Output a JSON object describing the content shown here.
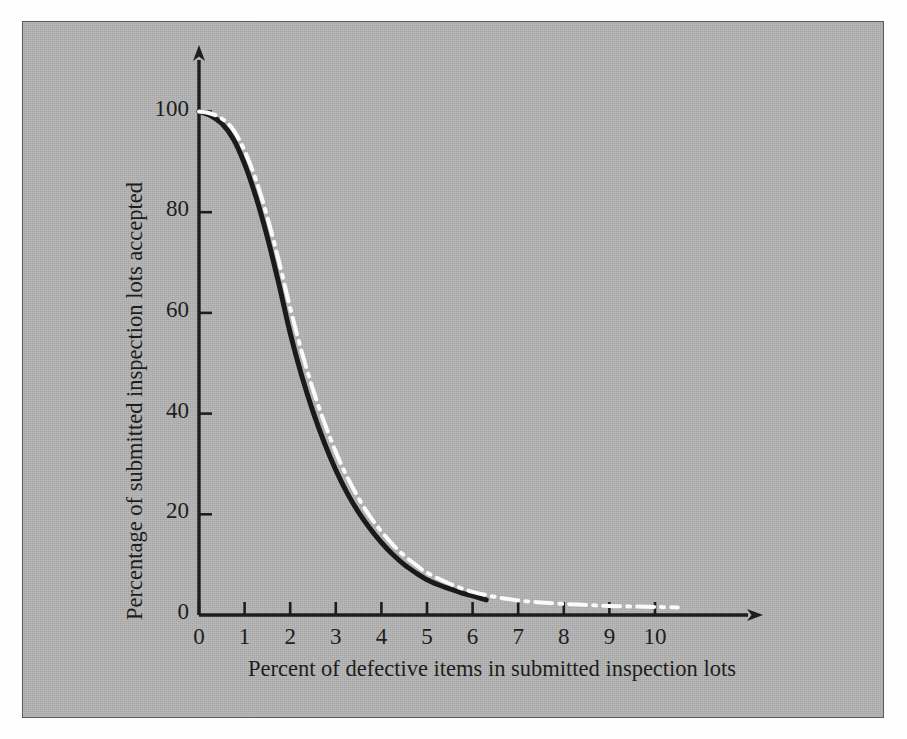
{
  "figure": {
    "background_color": "#b4b4b4",
    "border_color": "#5a5a5a",
    "page_color": "#fefefe"
  },
  "chart_data": {
    "type": "line",
    "title": "",
    "xlabel": "Percent of defective items in submitted inspection lots",
    "ylabel": "Percentage of submitted inspection lots accepted",
    "xlim": [
      0,
      10.6
    ],
    "ylim": [
      0,
      104
    ],
    "xticks": [
      "0",
      "1",
      "2",
      "3",
      "4",
      "5",
      "6",
      "7",
      "8",
      "9",
      "10"
    ],
    "xtick_values": [
      0,
      1,
      2,
      3,
      4,
      5,
      6,
      7,
      8,
      9,
      10
    ],
    "yticks": [
      "0",
      "20",
      "40",
      "60",
      "80",
      "100"
    ],
    "ytick_values": [
      0,
      20,
      40,
      60,
      80,
      100
    ],
    "grid": false,
    "legend": "none",
    "axis_arrows": true,
    "series": [
      {
        "name": "solid-oc-curve",
        "style": "solid",
        "color": "#1a1a1a",
        "width": 5.0,
        "x": [
          0.0,
          0.25,
          0.5,
          0.75,
          1.0,
          1.25,
          1.5,
          1.75,
          2.0,
          2.25,
          2.5,
          2.75,
          3.0,
          3.25,
          3.5,
          3.75,
          4.0,
          4.25,
          4.5,
          4.75,
          5.0,
          5.25,
          5.5,
          5.75,
          6.0,
          6.3
        ],
        "values": [
          100.0,
          99.2,
          97.6,
          94.6,
          89.6,
          83.0,
          75.0,
          65.8,
          56.0,
          47.6,
          40.4,
          34.2,
          28.8,
          24.2,
          20.4,
          17.2,
          14.4,
          12.0,
          10.0,
          8.4,
          7.0,
          6.0,
          5.2,
          4.4,
          3.8,
          3.0
        ]
      },
      {
        "name": "dash-dot-oc-curve",
        "style": "dash-dot",
        "color": "#fafafa",
        "width": 4.0,
        "x": [
          0.0,
          0.25,
          0.5,
          0.75,
          1.0,
          1.25,
          1.5,
          1.75,
          2.0,
          2.25,
          2.5,
          2.75,
          3.0,
          3.25,
          3.5,
          3.75,
          4.0,
          4.25,
          4.5,
          4.75,
          5.0,
          5.5,
          6.0,
          6.5,
          7.0,
          7.5,
          8.0,
          8.5,
          9.0,
          9.5,
          10.0,
          10.5
        ],
        "values": [
          100.0,
          99.6,
          98.6,
          96.4,
          92.2,
          86.4,
          79.0,
          70.4,
          61.0,
          52.4,
          44.8,
          38.2,
          32.4,
          27.4,
          23.2,
          19.6,
          16.6,
          14.0,
          11.8,
          10.0,
          8.4,
          6.2,
          4.6,
          3.6,
          2.9,
          2.5,
          2.2,
          2.0,
          1.8,
          1.7,
          1.6,
          1.5
        ]
      }
    ]
  }
}
